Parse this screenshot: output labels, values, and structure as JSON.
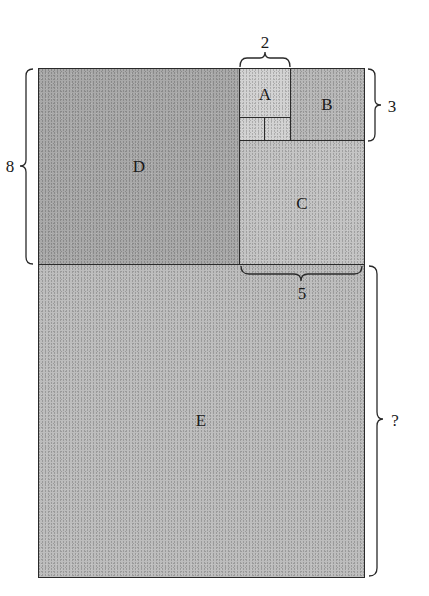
{
  "diagram": {
    "type": "fibonacci-rectangle-tiling",
    "regions": [
      {
        "id": "D",
        "label": "D",
        "color": "#a9a9a9"
      },
      {
        "id": "A",
        "label": "A",
        "color": "#d2d2d2"
      },
      {
        "id": "B",
        "label": "B",
        "color": "#b8b8b8"
      },
      {
        "id": "C",
        "label": "C",
        "color": "#c4c4c4"
      },
      {
        "id": "E",
        "label": "E",
        "color": "#bdbdbd"
      },
      {
        "id": "small1",
        "label": "",
        "color": "#d2d2d2"
      },
      {
        "id": "small2",
        "label": "",
        "color": "#d2d2d2"
      }
    ],
    "dimensions": {
      "top": "2",
      "right_upper": "3",
      "left": "8",
      "middle": "5",
      "right_lower": "?"
    },
    "line_color": "#2a2a2a"
  }
}
